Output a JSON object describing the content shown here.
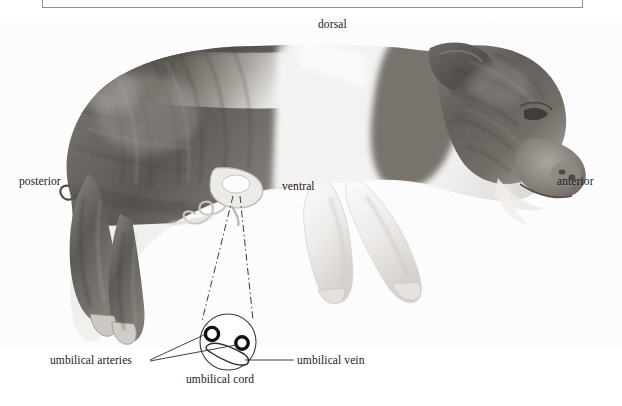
{
  "figure": {
    "background_color": "#ffffff",
    "caption_box": {
      "present": true,
      "border_color": "#8d8d91",
      "text": ""
    },
    "orientation_labels": [
      {
        "key": "dorsal",
        "text": "dorsal",
        "x": 318,
        "y": 18
      },
      {
        "key": "ventral",
        "text": "ventral",
        "x": 282,
        "y": 180
      },
      {
        "key": "posterior",
        "text": "posterior",
        "x": 19,
        "y": 175
      },
      {
        "key": "anterior",
        "text": "anterior",
        "x": 557,
        "y": 175
      }
    ],
    "detail_inset": {
      "title": "umbilical cord cross section",
      "circle": {
        "cx": 228,
        "cy": 342,
        "r": 28
      },
      "structures": [
        {
          "key": "umbilical_artery_left",
          "label": "umbilical arteries",
          "cx": 212,
          "cy": 334,
          "r": 7
        },
        {
          "key": "umbilical_artery_right",
          "label": "umbilical arteries",
          "cx": 242,
          "cy": 343,
          "r": 7
        },
        {
          "key": "umbilical_vein",
          "label": "umbilical vein"
        }
      ]
    },
    "callout_labels": [
      {
        "key": "umbilical-arteries",
        "text": "umbilical arteries"
      },
      {
        "key": "umbilical-vein",
        "text": "umbilical vein"
      },
      {
        "key": "umbilical-cord",
        "text": "umbilical cord"
      }
    ]
  },
  "labels": {
    "dorsal": "dorsal",
    "ventral": "ventral",
    "posterior": "posterior",
    "anterior": "anterior",
    "umbilical_arteries": "umbilical arteries",
    "umbilical_vein": "umbilical vein",
    "umbilical_cord": "umbilical cord"
  },
  "colors": {
    "text": "#1a1a1a",
    "line": "#2b2b2b",
    "box_border": "#8d8d91",
    "background": "#ffffff",
    "specimen_dark": "#5d5a57",
    "specimen_mid": "#8d8a86",
    "specimen_light": "#e9e7e4"
  }
}
